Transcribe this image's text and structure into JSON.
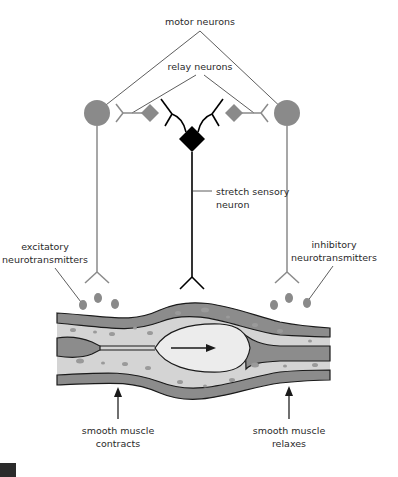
{
  "diagram": {
    "type": "stretch reflex of smooth muscle (peristalsis)",
    "labels": {
      "motor_neurons": "motor neurons",
      "relay_neurons": "relay neurons",
      "stretch_sensory_neuron_line1": "stretch sensory",
      "stretch_sensory_neuron_line2": "neuron",
      "excitatory_line1": "excitatory",
      "excitatory_line2": "neurotransmitters",
      "inhibitory_line1": "inhibitory",
      "inhibitory_line2": "neurotransmitters",
      "contracts_line1": "smooth muscle",
      "contracts_line2": "contracts",
      "relaxes_line1": "smooth muscle",
      "relaxes_line2": "relaxes"
    },
    "colors": {
      "motor_neuron": "#8a8a8a",
      "relay_neuron": "#8a8a8a",
      "sensory_neuron": "#000000",
      "muscle_dark": "#8c8c8c",
      "muscle_light": "#d4d4d4",
      "lumen": "#ececec",
      "outline": "#1a1a1a"
    }
  }
}
